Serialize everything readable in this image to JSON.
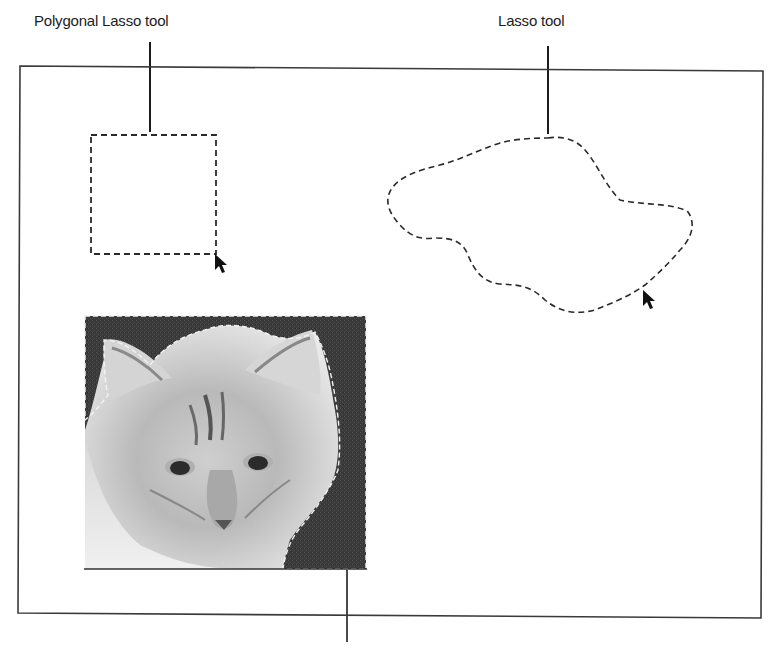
{
  "figure": {
    "callouts": [
      {
        "id": "polygonal-lasso",
        "label": "Polygonal Lasso tool"
      },
      {
        "id": "lasso",
        "label": "Lasso tool"
      },
      {
        "id": "magnetic-lasso",
        "label": ""
      }
    ],
    "selections": [
      {
        "id": "polygonal-lasso-selection",
        "shape": "rectangle",
        "style": "marching-ants"
      },
      {
        "id": "lasso-selection",
        "shape": "freeform",
        "style": "marching-ants"
      },
      {
        "id": "magnetic-lasso-selection",
        "shape": "edge-traced background around cat",
        "style": "marching-ants"
      }
    ],
    "image": {
      "subject": "cat face photo (grayscale)"
    },
    "cursors": [
      "arrow-cursor",
      "arrow-cursor"
    ],
    "colors": {
      "line": "#1c1c1c",
      "frame": "#3a3a3a",
      "background": "#ffffff",
      "photo_bg": "#3d3d3d"
    }
  }
}
